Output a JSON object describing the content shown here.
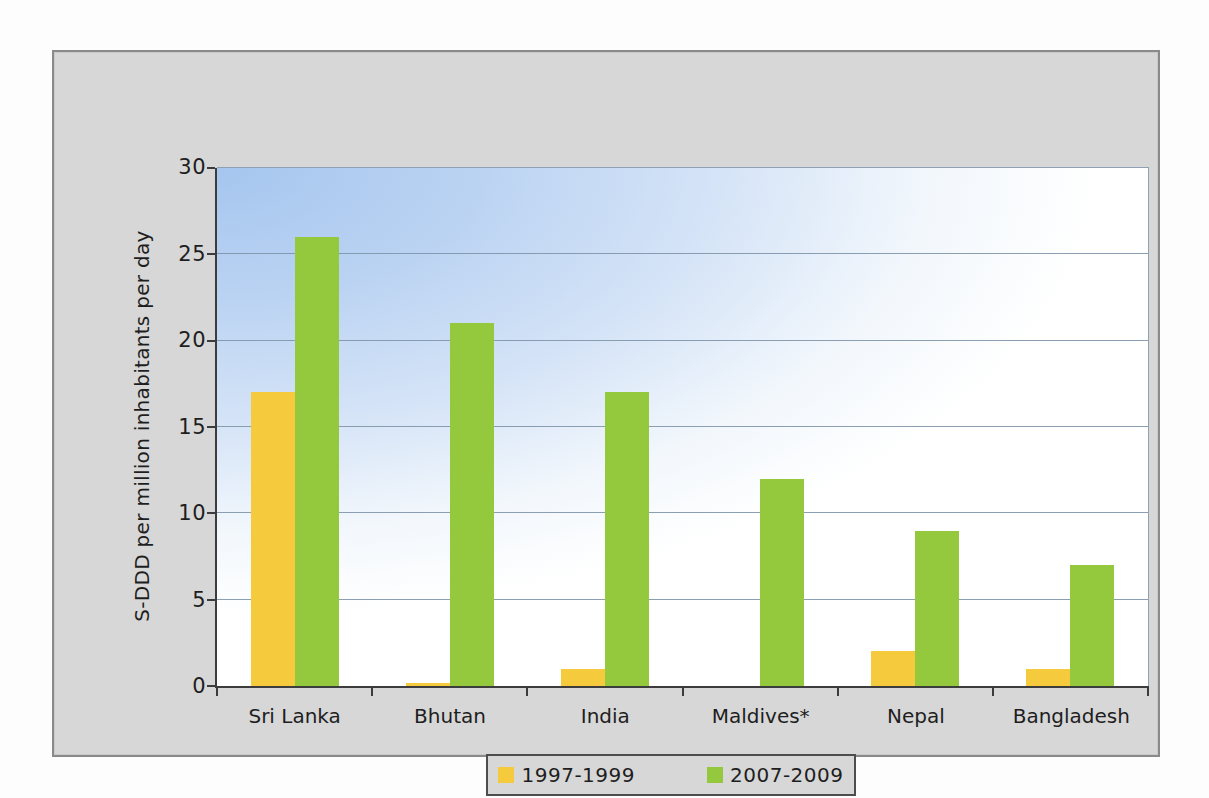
{
  "figure": {
    "panel_background": "#d7d7d7",
    "plot_gradient_top_left": "#a6c6ef",
    "plot_gradient_bottom_right": "#ffffff"
  },
  "chart_data": {
    "type": "bar",
    "title": "",
    "xlabel": "",
    "ylabel": "S-DDD per million inhabitants per day",
    "ylim": [
      0,
      30
    ],
    "yticks": [
      0,
      5,
      10,
      15,
      20,
      25,
      30
    ],
    "grid": "horizontal",
    "legend_position": "bottom",
    "categories": [
      "Sri Lanka",
      "Bhutan",
      "India",
      "Maldives*",
      "Nepal",
      "Bangladesh"
    ],
    "series": [
      {
        "name": "1997-1999",
        "color": "#f5ca3c",
        "values": [
          17,
          0.2,
          1,
          0,
          2,
          1
        ]
      },
      {
        "name": "2007-2009",
        "color": "#95c93d",
        "values": [
          26,
          21,
          17,
          12,
          9,
          7
        ]
      }
    ]
  },
  "legend": {
    "items": [
      {
        "label": "1997-1999"
      },
      {
        "label": "2007-2009"
      }
    ]
  }
}
